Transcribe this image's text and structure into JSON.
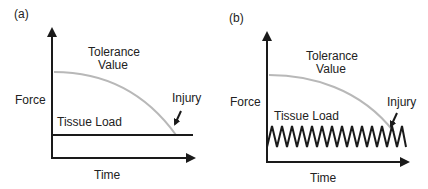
{
  "panels": [
    {
      "label": "(a)",
      "y_axis": "Force",
      "x_axis": "Time",
      "tolerance_label_1": "Tolerance",
      "tolerance_label_2": "Value",
      "load_label": "Tissue Load",
      "injury_label": "Injury",
      "load_type": "constant"
    },
    {
      "label": "(b)",
      "y_axis": "Force",
      "x_axis": "Time",
      "tolerance_label_1": "Tolerance",
      "tolerance_label_2": "Value",
      "load_label": "Tissue Load",
      "injury_label": "Injury",
      "load_type": "cyclic"
    }
  ],
  "colors": {
    "axis": "#1a1a1a",
    "tolerance": "#b8b8b8",
    "load": "#1a1a1a"
  }
}
